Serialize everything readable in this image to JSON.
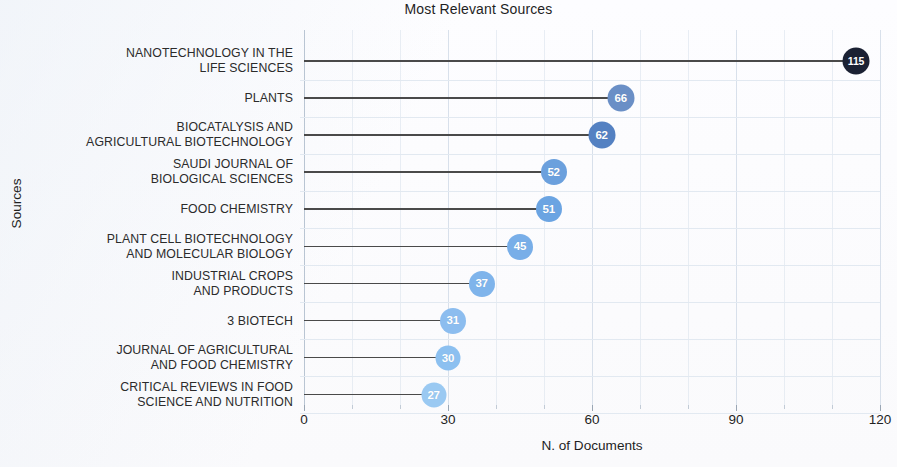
{
  "chart_data": {
    "type": "bar",
    "subtype": "lollipop-horizontal",
    "title": "Most Relevant Sources",
    "xlabel": "N. of Documents",
    "ylabel": "Sources",
    "xlim": [
      0,
      120
    ],
    "xticks": [
      0,
      30,
      60,
      90,
      120
    ],
    "xtick_labels": [
      "0",
      "30",
      "60",
      "90",
      "120"
    ],
    "xminor_ticks": [
      10,
      20,
      40,
      50,
      70,
      80,
      100,
      110
    ],
    "grid": true,
    "legend": "none",
    "orientation": "horizontal",
    "categories": [
      "NANOTECHNOLOGY IN THE\nLIFE SCIENCES",
      "PLANTS",
      "BIOCATALYSIS AND\nAGRICULTURAL BIOTECHNOLOGY",
      "SAUDI JOURNAL OF\nBIOLOGICAL SCIENCES",
      "FOOD CHEMISTRY",
      "PLANT CELL BIOTECHNOLOGY\nAND MOLECULAR BIOLOGY",
      "INDUSTRIAL CROPS\nAND PRODUCTS",
      "3 BIOTECH",
      "JOURNAL OF AGRICULTURAL\nAND FOOD CHEMISTRY",
      "CRITICAL REVIEWS IN FOOD\nSCIENCE AND NUTRITION"
    ],
    "values": [
      115,
      66,
      62,
      52,
      51,
      45,
      37,
      31,
      30,
      27
    ],
    "point_labels": [
      "115",
      "66",
      "62",
      "52",
      "51",
      "45",
      "37",
      "31",
      "30",
      "27"
    ],
    "point_colors": [
      "#1b2133",
      "#6a8fc6",
      "#5481c2",
      "#6ba0dd",
      "#6ba4e2",
      "#78aee8",
      "#7fb4eb",
      "#8cbdef",
      "#8cc0f0",
      "#9ac9f2"
    ],
    "point_radii": [
      13.5,
      13.5,
      13.5,
      13,
      13,
      13,
      13,
      13,
      12.5,
      12.5
    ],
    "stem_color": "#4a4a4a",
    "grid_color": "#d7e0ea",
    "background": "#fdfdfd"
  }
}
